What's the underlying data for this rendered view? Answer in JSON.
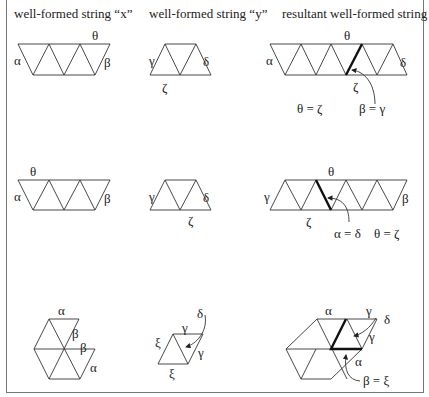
{
  "headers": {
    "col1": "well-formed string “x”",
    "col2": "well-formed string “y”",
    "col3": "resultant well-formed string"
  },
  "row1": {
    "x": {
      "top": "θ",
      "left": "α",
      "right": "β"
    },
    "y": {
      "left": "γ",
      "right": "δ",
      "bottom": "ζ"
    },
    "result": {
      "top": "θ",
      "left": "α",
      "right": "δ",
      "bottom": "ζ",
      "eq1": "θ = ζ",
      "eq2": "β = γ"
    }
  },
  "row2": {
    "x": {
      "top": "θ",
      "left": "α",
      "right": "β"
    },
    "y": {
      "left": "γ",
      "right": "δ",
      "bottom": "ζ"
    },
    "result": {
      "top": "θ",
      "left": "γ",
      "right": "β",
      "bottom": "ζ",
      "eq1": "α = δ",
      "eq2": "θ = ζ"
    }
  },
  "row3": {
    "x": {
      "top": "α",
      "beta1": "β",
      "beta2": "β",
      "alpha2": "α"
    },
    "y": {
      "delta": "δ",
      "gamma1": "γ",
      "gamma2": "γ",
      "xi1": "ξ",
      "xi2": "ξ"
    },
    "result": {
      "alpha1": "α",
      "gamma1": "γ",
      "delta": "δ",
      "gamma2": "γ",
      "alpha2": "α",
      "eq": "β = ξ"
    }
  }
}
